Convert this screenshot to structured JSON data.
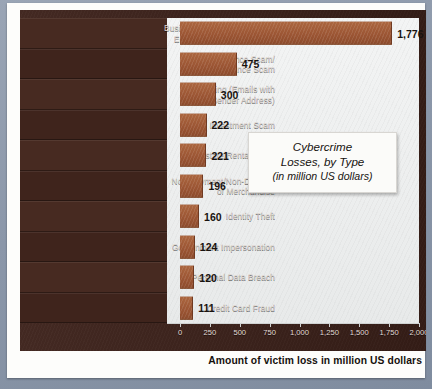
{
  "chart_data": {
    "type": "bar",
    "orientation": "horizontal",
    "title": "Cybercrime Losses, by Type",
    "subtitle": "(in million US dollars)",
    "title_lines": [
      "Cybercrime",
      "Losses, by Type"
    ],
    "xlabel": "Amount of victim loss in million US dollars",
    "ylabel": "",
    "xlim": [
      0,
      2000
    ],
    "grid": false,
    "legend": null,
    "categories": [
      "Business Email Compromise/ Email Access Compromise",
      "Confidence Scam/ Romance Scam",
      "Spoofing (Emails with Forged Sender Address)",
      "Online Investment Scam",
      "Real Estate/Rental Scam",
      "Non-Payment/Non-Delivery of Merchandise",
      "Identity Theft",
      "Government Impersonation",
      "Personal Data Breach",
      "Credit Card Fraud"
    ],
    "values": [
      1776,
      475,
      300,
      222,
      221,
      196,
      160,
      124,
      120,
      111
    ],
    "value_labels": [
      "1,776",
      "475",
      "300",
      "222",
      "221",
      "196",
      "160",
      "124",
      "120",
      "111"
    ],
    "xticks": [
      0,
      250,
      500,
      750,
      1000,
      1250,
      1500,
      1750,
      2000
    ],
    "xtick_labels": [
      "0",
      "250",
      "500",
      "750",
      "1,000",
      "1,250",
      "1,500",
      "1,750",
      "2,000"
    ],
    "bar_color": "#a05b38",
    "panel_color": "#3c211a",
    "plot_background": "#eef0f0"
  },
  "rows": [
    {
      "label_lines": [
        "Business Email Compromise/",
        "Email Access Compromise"
      ],
      "value": 1776,
      "value_label": "1,776"
    },
    {
      "label_lines": [
        "Confidence Scam/",
        "Romance Scam"
      ],
      "value": 475,
      "value_label": "475"
    },
    {
      "label_lines": [
        "Spoofing (Emails with",
        "Forged Sender Address)"
      ],
      "value": 300,
      "value_label": "300"
    },
    {
      "label_lines": [
        "Online Investment Scam"
      ],
      "value": 222,
      "value_label": "222"
    },
    {
      "label_lines": [
        "Real Estate/Rental Scam"
      ],
      "value": 221,
      "value_label": "221"
    },
    {
      "label_lines": [
        "Non-Payment/Non-Delivery",
        "of Merchandise"
      ],
      "value": 196,
      "value_label": "196"
    },
    {
      "label_lines": [
        "Identity Theft"
      ],
      "value": 160,
      "value_label": "160"
    },
    {
      "label_lines": [
        "Government Impersonation"
      ],
      "value": 124,
      "value_label": "124"
    },
    {
      "label_lines": [
        "Personal Data Breach"
      ],
      "value": 120,
      "value_label": "120"
    },
    {
      "label_lines": [
        "Credit Card Fraud"
      ],
      "value": 111,
      "value_label": "111"
    }
  ],
  "caption": "Amount of victim loss in million US dollars"
}
